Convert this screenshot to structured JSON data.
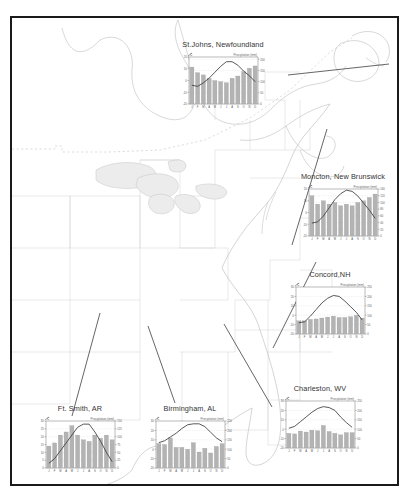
{
  "figure": {
    "title": "",
    "map_region": "Eastern North America",
    "frame_color": "#1a1a1a"
  },
  "axis": {
    "temp_unit_label": "C",
    "precip_label": "Precipitation (mm)",
    "month_labels": [
      "J",
      "F",
      "M",
      "A",
      "M",
      "J",
      "J",
      "A",
      "S",
      "O",
      "N",
      "D"
    ]
  },
  "chart_data": [
    {
      "type": "bar",
      "title": "St.Johns, Newfoundland",
      "categories": [
        "J",
        "F",
        "M",
        "A",
        "M",
        "J",
        "J",
        "A",
        "S",
        "O",
        "N",
        "D"
      ],
      "series": [
        {
          "name": "Precipitation (mm)",
          "type": "bar",
          "values": [
            165,
            140,
            130,
            115,
            105,
            100,
            95,
            115,
            125,
            145,
            160,
            170
          ]
        },
        {
          "name": "Temperature (C)",
          "type": "line",
          "values": [
            -4,
            -5,
            -2,
            2,
            7,
            12,
            16,
            16,
            13,
            8,
            4,
            -1
          ]
        }
      ],
      "xlabel": "",
      "ylabel": "C",
      "y2label": "Precipitation (mm)",
      "ylim": [
        -20,
        20
      ],
      "y2lim": [
        0,
        210
      ],
      "yticks": [
        -20,
        -10,
        0,
        10,
        20
      ],
      "y2ticks": [
        0,
        50,
        100,
        150,
        200
      ],
      "grid": true
    },
    {
      "type": "bar",
      "title": "Moncton, New Brunswick",
      "categories": [
        "J",
        "F",
        "M",
        "A",
        "M",
        "J",
        "J",
        "A",
        "S",
        "O",
        "N",
        "D"
      ],
      "series": [
        {
          "name": "Precipitation (mm)",
          "type": "bar",
          "values": [
            120,
            95,
            105,
            95,
            100,
            90,
            95,
            90,
            100,
            105,
            115,
            125
          ]
        },
        {
          "name": "Temperature (C)",
          "type": "line",
          "values": [
            -9,
            -8,
            -3,
            4,
            11,
            16,
            19,
            18,
            14,
            8,
            2,
            -5
          ]
        }
      ],
      "xlabel": "",
      "ylabel": "C",
      "y2label": "Precipitation (mm)",
      "ylim": [
        -20,
        20
      ],
      "y2lim": [
        0,
        140
      ],
      "yticks": [
        -20,
        -10,
        0,
        10,
        20
      ],
      "y2ticks": [
        0,
        20,
        40,
        60,
        80,
        100,
        120,
        140
      ],
      "grid": true
    },
    {
      "type": "bar",
      "title": "Concord,NH",
      "categories": [
        "J",
        "F",
        "M",
        "A",
        "M",
        "J",
        "J",
        "A",
        "S",
        "O",
        "N",
        "D"
      ],
      "series": [
        {
          "name": "Precipitation (mm)",
          "type": "bar",
          "values": [
            70,
            70,
            78,
            80,
            85,
            90,
            95,
            88,
            88,
            92,
            100,
            85
          ]
        },
        {
          "name": "Temperature (C)",
          "type": "line",
          "values": [
            -8,
            -7,
            -1,
            6,
            13,
            18,
            21,
            20,
            15,
            9,
            3,
            -5
          ]
        }
      ],
      "xlabel": "",
      "ylabel": "C",
      "y2label": "Precipitation (mm)",
      "ylim": [
        -20,
        30
      ],
      "y2lim": [
        0,
        250
      ],
      "yticks": [
        -20,
        -10,
        0,
        10,
        20,
        30
      ],
      "y2ticks": [
        0,
        50,
        100,
        150,
        200,
        250
      ],
      "grid": true
    },
    {
      "type": "bar",
      "title": "Charleston, WV",
      "categories": [
        "J",
        "F",
        "M",
        "A",
        "M",
        "J",
        "J",
        "A",
        "S",
        "O",
        "N",
        "D"
      ],
      "series": [
        {
          "name": "Precipitation (mm)",
          "type": "bar",
          "values": [
            78,
            75,
            90,
            85,
            95,
            92,
            120,
            88,
            78,
            70,
            82,
            82
          ]
        },
        {
          "name": "Temperature (C)",
          "type": "line",
          "values": [
            1,
            3,
            8,
            13,
            18,
            22,
            24,
            23,
            20,
            13,
            7,
            2
          ]
        }
      ],
      "xlabel": "",
      "ylabel": "C",
      "y2label": "Precipitation (mm)",
      "ylim": [
        -20,
        30
      ],
      "y2lim": [
        0,
        250
      ],
      "yticks": [
        -20,
        -10,
        0,
        10,
        20,
        30
      ],
      "y2ticks": [
        0,
        50,
        100,
        150,
        200,
        250
      ],
      "grid": true
    },
    {
      "type": "bar",
      "title": "Ft. Smith, AR",
      "categories": [
        "J",
        "F",
        "M",
        "A",
        "M",
        "J",
        "J",
        "A",
        "S",
        "O",
        "N",
        "D"
      ],
      "series": [
        {
          "name": "Precipitation (mm)",
          "type": "bar",
          "values": [
            70,
            80,
            105,
            115,
            135,
            105,
            90,
            85,
            105,
            95,
            105,
            90
          ]
        },
        {
          "name": "Temperature (C)",
          "type": "line",
          "values": [
            3,
            6,
            11,
            16,
            21,
            26,
            28,
            28,
            23,
            17,
            10,
            4
          ]
        }
      ],
      "xlabel": "",
      "ylabel": "C",
      "y2label": "Precipitation (mm)",
      "ylim": [
        0,
        30
      ],
      "y2lim": [
        0,
        150
      ],
      "yticks": [
        0,
        5,
        10,
        15,
        20,
        25,
        30
      ],
      "y2ticks": [
        0,
        25,
        50,
        75,
        100,
        125,
        150
      ],
      "grid": true
    },
    {
      "type": "bar",
      "title": "Birmingham, AL",
      "categories": [
        "J",
        "F",
        "M",
        "A",
        "M",
        "J",
        "J",
        "A",
        "S",
        "O",
        "N",
        "D"
      ],
      "series": [
        {
          "name": "Precipitation (mm)",
          "type": "bar",
          "values": [
            130,
            125,
            160,
            110,
            110,
            100,
            135,
            85,
            105,
            80,
            115,
            130
          ]
        },
        {
          "name": "Temperature (C)",
          "type": "line",
          "values": [
            7,
            9,
            13,
            17,
            22,
            26,
            27,
            27,
            24,
            18,
            12,
            8
          ]
        }
      ],
      "xlabel": "",
      "ylabel": "C",
      "y2label": "Precipitation (mm)",
      "ylim": [
        -20,
        30
      ],
      "y2lim": [
        0,
        250
      ],
      "yticks": [
        -20,
        -10,
        0,
        10,
        20,
        30
      ],
      "y2ticks": [
        0,
        50,
        100,
        150,
        200,
        250
      ],
      "grid": true
    }
  ],
  "colors": {
    "bar": "#b3b3b3",
    "bar_edge": "#9a9a9a",
    "line": "#3a3a3a",
    "grid": "#c9c9c9",
    "axis": "#555555",
    "coastline": "#b5b5b5",
    "border": "#cfcfcf",
    "lake": "#e9e9e9",
    "leader": "#4a4a4a"
  }
}
